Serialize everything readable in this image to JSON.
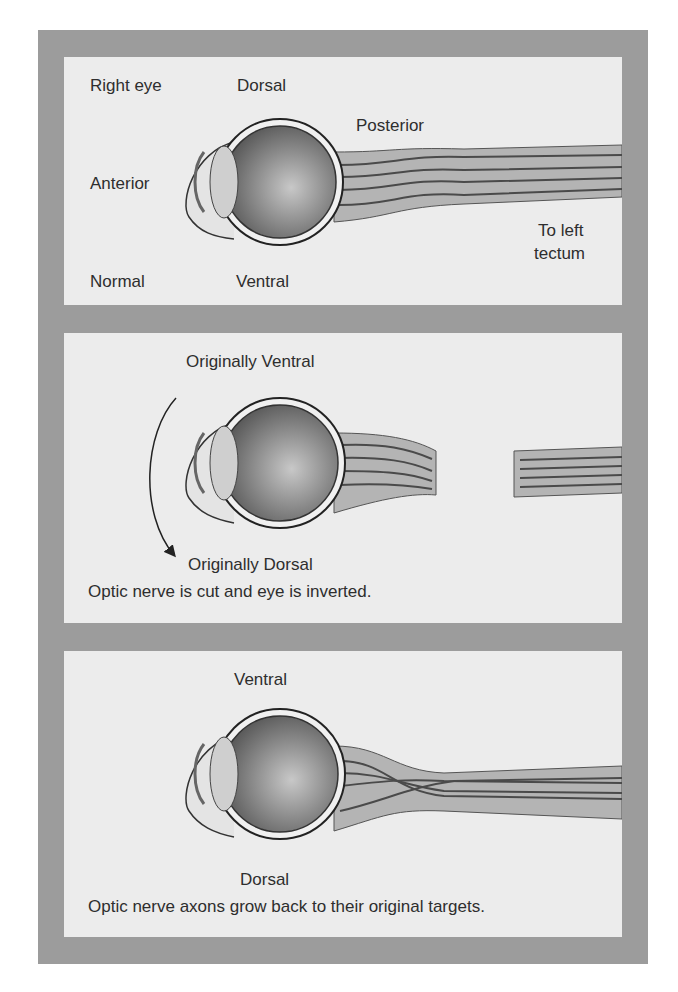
{
  "figure": {
    "panels": [
      {
        "id": "normal",
        "labels": {
          "side": "Right eye",
          "top": "Dorsal",
          "front": "Anterior",
          "back": "Posterior",
          "target": "To left\ntectum",
          "target_line1": "To left",
          "target_line2": "tectum",
          "condition": "Normal",
          "bottom": "Ventral"
        }
      },
      {
        "id": "cut-inverted",
        "labels": {
          "top": "Originally Ventral",
          "bottom": "Originally Dorsal",
          "caption": "Optic nerve is cut and eye is inverted."
        }
      },
      {
        "id": "regrowth",
        "labels": {
          "top": "Ventral",
          "bottom": "Dorsal",
          "caption": "Optic nerve axons grow back to their original targets."
        }
      }
    ],
    "colors": {
      "frame": "#9c9c9c",
      "panel": "#ececec",
      "text": "#2e2e2e",
      "nerve": "#b4b4b4",
      "axon": "#4a4a4a"
    }
  }
}
